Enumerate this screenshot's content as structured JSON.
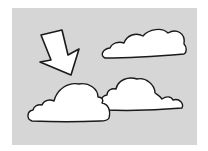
{
  "illustration": {
    "description": "Hand-drawn arrow pointing down-right toward clouds on a gray background",
    "colors": {
      "page": "#ffffff",
      "panel": "#d6d6d6",
      "fill": "#ffffff",
      "stroke": "#1a1a1a"
    },
    "elements": [
      {
        "name": "arrow",
        "direction": "down-right"
      },
      {
        "name": "cloud-top-right"
      },
      {
        "name": "cloud-bottom-left"
      },
      {
        "name": "cloud-bottom-right"
      }
    ]
  }
}
